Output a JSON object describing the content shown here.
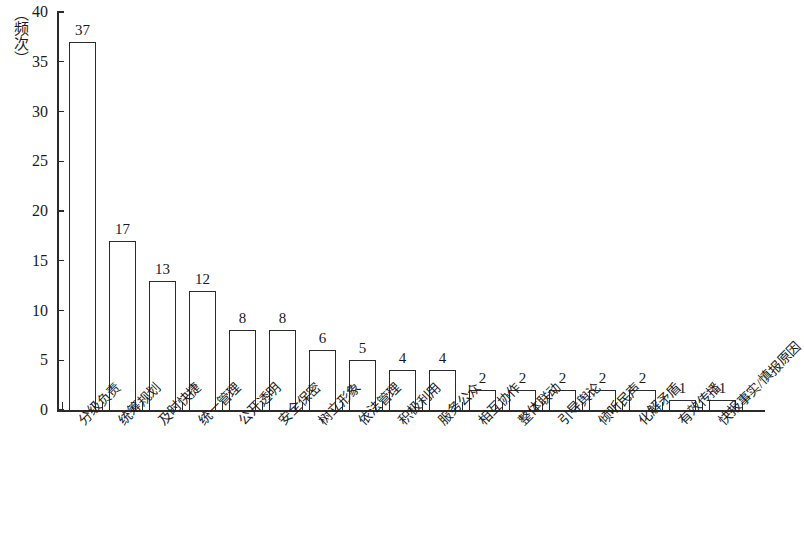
{
  "chart_data": {
    "type": "bar",
    "title": "",
    "xlabel": "",
    "ylabel": "（频次）",
    "ylim": [
      0,
      40
    ],
    "ytick_values": [
      0,
      5,
      10,
      15,
      20,
      25,
      30,
      35,
      40
    ],
    "ytick_labels": [
      "0",
      "5",
      "10",
      "15",
      "20",
      "25",
      "30",
      "35",
      "40"
    ],
    "grid": false,
    "legend": null,
    "categories": [
      "分级负责",
      "统筹规划",
      "及时快捷",
      "统一管理",
      "公开透明",
      "安全保密",
      "树立形象",
      "依法管理",
      "积极利用",
      "服务公众",
      "相互协作",
      "整体联动",
      "引导舆论",
      "倾听民声",
      "化解矛盾",
      "有效传播",
      "快报事实/慎报原因"
    ],
    "values": [
      37,
      17,
      13,
      12,
      8,
      8,
      6,
      5,
      4,
      4,
      2,
      2,
      2,
      2,
      2,
      1,
      1
    ],
    "value_labels": [
      "37",
      "17",
      "13",
      "12",
      "8",
      "8",
      "6",
      "5",
      "4",
      "4",
      "2",
      "2",
      "2",
      "2",
      "2",
      "1",
      "1"
    ],
    "bar_style": {
      "fill": "#ffffff",
      "edge": "#2b2b2b",
      "edge_width": 1.4
    }
  }
}
